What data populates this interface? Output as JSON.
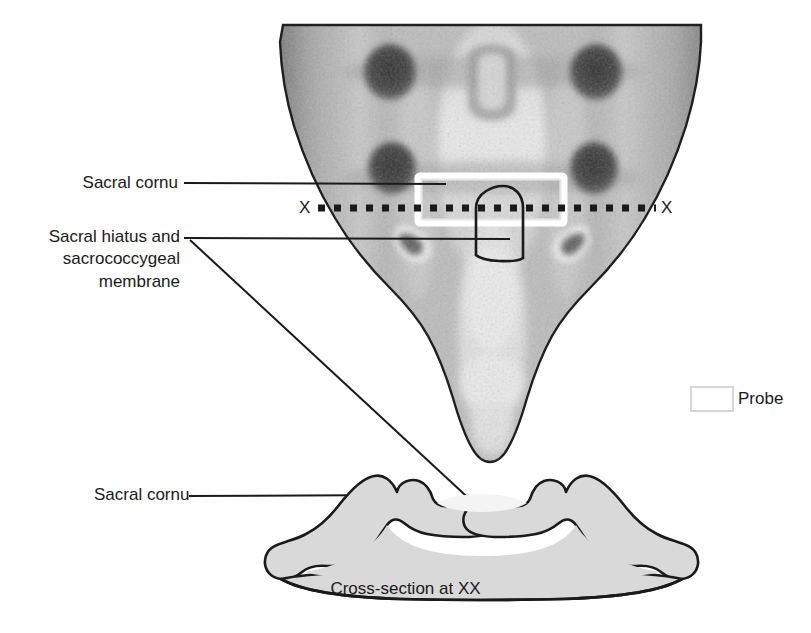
{
  "figure": {
    "caption": "Cross-section at XX",
    "section_marker_left": "X",
    "section_marker_right": "X"
  },
  "labels": {
    "sacral_cornu_top": "Sacral cornu",
    "sacral_hiatus": "Sacral hiatus and sacrococcygeal membrane",
    "sacral_cornu_bottom": "Sacral cornu"
  },
  "legend": {
    "probe_label": "Probe",
    "probe_swatch_border_color": "#d6d6d6",
    "probe_swatch_fill_color": "#ffffff"
  },
  "colors": {
    "background": "#ffffff",
    "line": "#1a1a1a",
    "text": "#1a1a1a",
    "bone_fill": "#d9d9d9",
    "bone_outline": "#1a1a1a",
    "canal_fill": "#f2f2f2",
    "probe_outline": "#ffffff",
    "probe_inner_outline": "#e8e8e8",
    "photo_light": "#e0e0e0",
    "photo_mid": "#9a9a9a",
    "photo_dark": "#4a4a4a",
    "foramen_dark": "#3d3d3d"
  },
  "panels": {
    "posterior_view": {
      "name": "Posterior view of sacrum and coccyx",
      "type": "grayscale-photograph",
      "foramina_count": 4
    },
    "cross_section": {
      "name": "Transverse cross-section at level XX",
      "type": "line-drawing",
      "fill": "#d9d9d9"
    }
  }
}
